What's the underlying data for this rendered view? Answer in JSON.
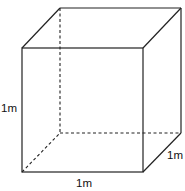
{
  "figure": {
    "type": "cube-perspective",
    "colors": {
      "stroke": "#222222",
      "background": "#ffffff"
    },
    "labels": {
      "height": "1m",
      "width": "1m",
      "depth": "1m"
    },
    "vertices": {
      "front_top_left": [
        22,
        48
      ],
      "front_top_right": [
        143,
        48
      ],
      "front_bottom_left": [
        22,
        172
      ],
      "front_bottom_right": [
        143,
        172
      ],
      "back_top_left": [
        60,
        8
      ],
      "back_top_right": [
        181,
        8
      ],
      "back_bottom_left": [
        60,
        133
      ],
      "back_bottom_right": [
        181,
        133
      ]
    },
    "hidden_edges": [
      "back_top_left-back_bottom_left",
      "back_bottom_left-back_bottom_right",
      "back_bottom_left-front_bottom_left"
    ]
  }
}
